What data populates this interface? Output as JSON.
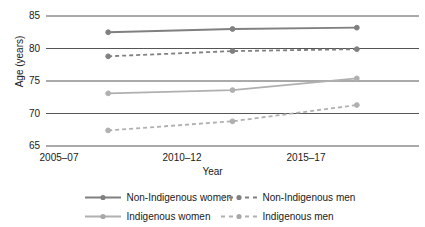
{
  "chart_data": {
    "type": "line",
    "title": "",
    "xlabel": "Year",
    "ylabel": "Age (years)",
    "categories": [
      "2005–07",
      "2010–12",
      "2015–17"
    ],
    "ylim": [
      65,
      85
    ],
    "yticks": [
      65,
      70,
      75,
      80,
      85
    ],
    "grid": true,
    "legend_position": "bottom",
    "series": [
      {
        "name": "Non-Indigenous women",
        "values": [
          82.5,
          83.0,
          83.2
        ],
        "style": "solid",
        "color": "#808080",
        "marker": "circle"
      },
      {
        "name": "Non-Indigenous men",
        "values": [
          78.8,
          79.6,
          79.9
        ],
        "style": "dashed",
        "color": "#808080",
        "marker": "circle"
      },
      {
        "name": "Indigenous women",
        "values": [
          73.1,
          73.6,
          75.4
        ],
        "style": "solid",
        "color": "#b0b0b0",
        "marker": "circle"
      },
      {
        "name": "Indigenous men",
        "values": [
          67.4,
          68.8,
          71.3
        ],
        "style": "dashed",
        "color": "#b0b0b0",
        "marker": "circle"
      }
    ]
  },
  "axis": {
    "y_label": "Age (years)",
    "x_label": "Year",
    "y_ticks": [
      "85",
      "80",
      "75",
      "70",
      "65"
    ],
    "x_ticks": [
      "2005–07",
      "2010–12",
      "2015–17"
    ]
  },
  "legend": {
    "items": [
      {
        "label": "Non-Indigenous women",
        "style": "solid",
        "color": "#808080"
      },
      {
        "label": "Non-Indigenous men",
        "style": "dashed",
        "color": "#808080"
      },
      {
        "label": "Indigenous women",
        "style": "solid",
        "color": "#b0b0b0"
      },
      {
        "label": "Indigenous men",
        "style": "dashed",
        "color": "#b0b0b0"
      }
    ]
  },
  "colors": {
    "gridline": "#555555",
    "non_indigenous": "#808080",
    "indigenous": "#b0b0b0",
    "text": "#1a1a1a",
    "background": "#ffffff"
  }
}
